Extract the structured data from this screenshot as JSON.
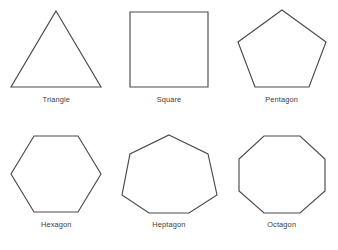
{
  "figure": {
    "background_color": "#ffffff",
    "stroke_color": "#4a4a4a",
    "fill_color": "#ffffff",
    "label_color": "#3a3a3a"
  },
  "chart_data": {
    "type": "diagram",
    "title": "",
    "subtitle": "",
    "xlabel": "",
    "ylabel": "",
    "grid": false,
    "legend": false,
    "layout": {
      "rows": 2,
      "columns": 3,
      "label_position": "below-shape"
    },
    "categories": [
      "Triangle",
      "Square",
      "Pentagon",
      "Hexagon",
      "Heptagon",
      "Octagon"
    ],
    "values": [
      3,
      4,
      5,
      6,
      7,
      8
    ],
    "series": [
      {
        "name": "Number of sides",
        "values": [
          3,
          4,
          5,
          6,
          7,
          8
        ]
      }
    ],
    "shapes": [
      {
        "label": "Triangle",
        "sides": 3,
        "orientation": "apex-up",
        "points": "48,3 93,79 3,79"
      },
      {
        "label": "Square",
        "sides": 4,
        "orientation": "axis-aligned",
        "points": "9,4 87,4 87,79 9,79"
      },
      {
        "label": "Pentagon",
        "sides": 5,
        "orientation": "apex-up",
        "points": "48,2 92,34 75,79 21,79 4,34"
      },
      {
        "label": "Hexagon",
        "sides": 6,
        "orientation": "flat-top",
        "points": "26,3 70,3 93,41 70,79 26,79 3,41"
      },
      {
        "label": "Heptagon",
        "sides": 7,
        "orientation": "apex-up",
        "points": "48,2 87,21 96,62 68,80 28,80 1,62 9,21"
      },
      {
        "label": "Octagon",
        "sides": 8,
        "orientation": "flat-top",
        "points": "30,3 66,3 91,26 91,58 66,80 30,80 5,58 5,26"
      }
    ]
  }
}
